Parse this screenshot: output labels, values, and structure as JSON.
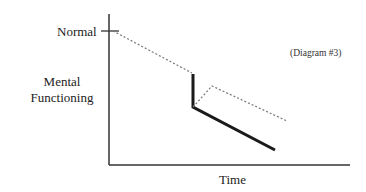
{
  "diagram": {
    "tag": "(Diagram #3)",
    "y_axis": {
      "label_line1": "Mental",
      "label_line2": "Functioning",
      "tick_label": "Normal"
    },
    "x_axis": {
      "label": "Time"
    },
    "colors": {
      "axis": "#333333",
      "solid": "#1a1a1a",
      "dotted": "#777777"
    },
    "series": [
      {
        "name": "baseline-decline",
        "style": "dotted",
        "points": [
          [
            113,
            31
          ],
          [
            192,
            73
          ]
        ]
      },
      {
        "name": "sudden-drop",
        "style": "solid",
        "points": [
          [
            193,
            74
          ],
          [
            193,
            107
          ],
          [
            275,
            150
          ]
        ]
      },
      {
        "name": "recovery-path",
        "style": "dotted",
        "points": [
          [
            193,
            107
          ],
          [
            212,
            86
          ],
          [
            287,
            121
          ]
        ]
      }
    ]
  }
}
